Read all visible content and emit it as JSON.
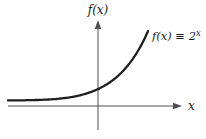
{
  "figure": {
    "labels": {
      "y_axis": "f(x)",
      "x_axis": "x",
      "equation_prefix": "f(x) ≡ 2",
      "equation_sup": "x"
    },
    "colors": {
      "curve": "#1f1f1f",
      "axis": "#4f4f4f",
      "text": "#1b1b1b",
      "background": "#ffffff"
    }
  },
  "chart_data": {
    "type": "line",
    "function_label": "f(x) ≡ 2^x",
    "base": 2,
    "xlabel": "x",
    "ylabel": "f(x)",
    "x_range": [
      -4,
      2.25
    ],
    "y_range": [
      0,
      4.8
    ],
    "grid": false,
    "legend": "none",
    "series": [
      {
        "name": "f(x) ≡ 2^x",
        "points": [
          {
            "x": -4,
            "y": 0.0625
          },
          {
            "x": -3,
            "y": 0.125
          },
          {
            "x": -2,
            "y": 0.25
          },
          {
            "x": -1,
            "y": 0.5
          },
          {
            "x": 0,
            "y": 1
          },
          {
            "x": 1,
            "y": 2
          },
          {
            "x": 2,
            "y": 4
          },
          {
            "x": 2.25,
            "y": 4.76
          }
        ]
      }
    ],
    "layout": {
      "origin_px": [
        98,
        106
      ],
      "px_per_unit_x": 22.5,
      "px_per_unit_y": 16,
      "asymptote_gap_px": 5.5,
      "curve_x_px_range": [
        8,
        148
      ]
    }
  }
}
